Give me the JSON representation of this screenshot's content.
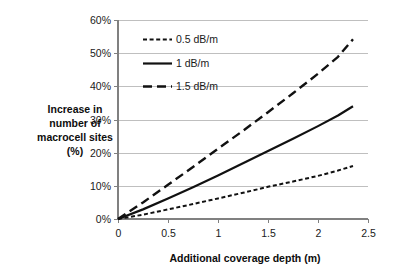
{
  "chart_data": {
    "type": "line",
    "title": "",
    "xlabel": "Additional coverage depth (m)",
    "ylabel": "Increase in number of macrocell sites (%)",
    "ylabel_lines": [
      "Increase in",
      "number of",
      "macrocell sites",
      "(%)"
    ],
    "xlim": [
      0,
      2.5
    ],
    "ylim": [
      0,
      60
    ],
    "xticks": [
      0,
      0.5,
      1,
      1.5,
      2,
      2.5
    ],
    "xtick_labels": [
      "0",
      "0.5",
      "1",
      "1.5",
      "2",
      "2.5"
    ],
    "yticks": [
      0,
      10,
      20,
      30,
      40,
      50,
      60
    ],
    "ytick_labels": [
      "0%",
      "10%",
      "20%",
      "30%",
      "40%",
      "50%",
      "60%"
    ],
    "grid": "horizontal",
    "legend_position": "upper-left-inside",
    "series": [
      {
        "name": "0.5 dB/m",
        "style": "short-dashed",
        "dasharray": "4,2.6",
        "width": 2.0,
        "color": "#111111",
        "x": [
          0,
          0.25,
          0.5,
          0.75,
          1,
          1.25,
          1.5,
          1.75,
          2,
          2.2,
          2.35
        ],
        "values": [
          0,
          1.3,
          2.9,
          4.5,
          6.2,
          7.9,
          9.7,
          11.3,
          13.0,
          14.6,
          16.0
        ]
      },
      {
        "name": "1 dB/m",
        "style": "solid",
        "dasharray": "",
        "width": 2.2,
        "color": "#111111",
        "x": [
          0,
          0.25,
          0.5,
          0.75,
          1,
          1.25,
          1.5,
          1.75,
          2,
          2.2,
          2.35
        ],
        "values": [
          0,
          2.9,
          6.2,
          9.6,
          13.1,
          16.8,
          20.5,
          24.2,
          28.0,
          31.2,
          34.0
        ]
      },
      {
        "name": "1.5 dB/m",
        "style": "long-dashed",
        "dasharray": "9,5",
        "width": 2.4,
        "color": "#111111",
        "x": [
          0,
          0.25,
          0.5,
          0.75,
          1,
          1.25,
          1.5,
          1.75,
          2,
          2.2,
          2.35
        ],
        "values": [
          0,
          5.0,
          10.3,
          15.7,
          21.2,
          26.6,
          32.2,
          37.9,
          43.8,
          48.9,
          54.2
        ]
      }
    ]
  },
  "legend": {
    "items": [
      {
        "label": "0.5 dB/m"
      },
      {
        "label": "1 dB/m"
      },
      {
        "label": "1.5 dB/m"
      }
    ]
  },
  "axes": {
    "x_title": "Additional coverage depth (m)",
    "y_title_lines": [
      "Increase in",
      "number of",
      "macrocell sites",
      "(%)"
    ],
    "x_tick_labels": [
      "0",
      "0.5",
      "1",
      "1.5",
      "2",
      "2.5"
    ],
    "y_tick_labels": [
      "0%",
      "10%",
      "20%",
      "30%",
      "40%",
      "50%",
      "60%"
    ]
  },
  "colors": {
    "line": "#111111",
    "grid": "#bfbfbf",
    "axis": "#808080",
    "text": "#1a1a1a",
    "background": "#ffffff"
  }
}
